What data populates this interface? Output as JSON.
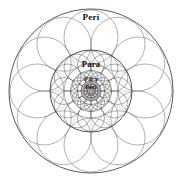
{
  "figure": {
    "name": "recursive-flower-of-life-mandala",
    "background_color": "#ffffff",
    "width": 182,
    "height": 184
  },
  "labels": {
    "outer": "Peri",
    "inner": "Para",
    "core_line_1": "Para",
    "core_line_2": "Peri"
  },
  "chart_data": {
    "type": "diagram",
    "title": "Peri",
    "subtitle": "Para",
    "center": [
      91,
      91
    ],
    "colors": {
      "outer_boundary": "#3a3a3a",
      "mid_boundary": "#2b2b2b",
      "petal_outer": "#8e8e8e",
      "petal_mid": "#6d6d6d",
      "petal_core": "#4a4a4a",
      "label_text": "#0d0d0d"
    },
    "stages": [
      {
        "name": "outer",
        "boundary_radius": 82,
        "petal_count": 12,
        "petal_radius": 27,
        "orbit_radius": 54,
        "stroke_width": 0.7
      },
      {
        "name": "mid",
        "boundary_radius": 41,
        "petal_count": 12,
        "petal_radius": 13.5,
        "orbit_radius": 27,
        "stroke_width": 0.6
      },
      {
        "name": "inner",
        "boundary_radius": 20.5,
        "petal_count": 12,
        "petal_radius": 6.8,
        "orbit_radius": 13.5,
        "stroke_width": 0.5
      },
      {
        "name": "core",
        "boundary_radius": 10,
        "petal_count": 12,
        "petal_radius": 3.4,
        "orbit_radius": 6.8,
        "stroke_width": 0.45
      },
      {
        "name": "nucleus",
        "boundary_radius": 5,
        "petal_count": 6,
        "petal_radius": 1.7,
        "orbit_radius": 3.4,
        "stroke_width": 0.4
      }
    ],
    "radial_spokes": {
      "count": 12,
      "length": 54,
      "stroke_width": 0.35,
      "color": "#9a9a9a"
    },
    "grid": false,
    "legend": false,
    "axis": false
  }
}
